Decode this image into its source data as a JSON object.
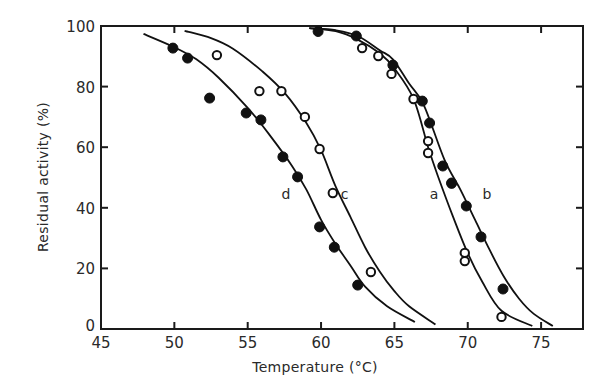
{
  "chart_data": {
    "type": "scatter",
    "title": "",
    "xlabel": "Temperature (°C)",
    "ylabel": "Residual activity (%)",
    "xlim": [
      45,
      78
    ],
    "ylim": [
      0,
      100
    ],
    "xticks": [
      45,
      50,
      55,
      60,
      65,
      70,
      75
    ],
    "yticks": [
      0,
      20,
      40,
      60,
      80,
      100
    ],
    "grid": false,
    "legend": "none (curves labelled inline a, b, c, d)",
    "series": [
      {
        "name": "a",
        "marker": "open",
        "points": [
          [
            62.8,
            92.7
          ],
          [
            63.9,
            90.1
          ],
          [
            64.8,
            84.2
          ],
          [
            66.3,
            75.9
          ],
          [
            67.3,
            62.0
          ],
          [
            67.3,
            58.1
          ],
          [
            68.9,
            48.0
          ],
          [
            69.8,
            25.1
          ],
          [
            69.8,
            22.4
          ],
          [
            72.3,
            4.0
          ]
        ],
        "curve": [
          [
            59.2,
            99.3
          ],
          [
            61,
            98.3
          ],
          [
            62.5,
            95.5
          ],
          [
            64,
            91
          ],
          [
            65,
            86
          ],
          [
            66.3,
            76
          ],
          [
            67.3,
            60
          ],
          [
            68,
            50
          ],
          [
            69,
            37
          ],
          [
            70,
            25
          ],
          [
            71,
            15.5
          ],
          [
            72.3,
            6
          ],
          [
            74.4,
            1
          ]
        ],
        "label_pos": [
          67.7,
          43
        ]
      },
      {
        "name": "b",
        "marker": "filled",
        "points": [
          [
            59.8,
            98.2
          ],
          [
            62.4,
            96.7
          ],
          [
            64.9,
            87.1
          ],
          [
            66.9,
            75.2
          ],
          [
            67.4,
            68.0
          ],
          [
            68.3,
            53.8
          ],
          [
            68.9,
            48.2
          ],
          [
            69.9,
            40.6
          ],
          [
            70.9,
            30.4
          ],
          [
            72.4,
            13.2
          ]
        ],
        "curve": [
          [
            59.2,
            99.3
          ],
          [
            61,
            98.6
          ],
          [
            62.5,
            96.7
          ],
          [
            64,
            92
          ],
          [
            64.9,
            89
          ],
          [
            66,
            81
          ],
          [
            67,
            74
          ],
          [
            68.4,
            56
          ],
          [
            69.5,
            46
          ],
          [
            70.5,
            36
          ],
          [
            71.5,
            26
          ],
          [
            72.5,
            17
          ],
          [
            73.5,
            10
          ],
          [
            74.5,
            5
          ],
          [
            75.8,
            1
          ]
        ],
        "label_pos": [
          71.3,
          43
        ]
      },
      {
        "name": "c",
        "marker": "open",
        "points": [
          [
            52.9,
            90.4
          ],
          [
            55.8,
            78.5
          ],
          [
            57.3,
            78.5
          ],
          [
            58.9,
            70.0
          ],
          [
            59.9,
            59.4
          ],
          [
            60.8,
            44.9
          ],
          [
            63.4,
            18.8
          ]
        ],
        "curve": [
          [
            50.7,
            98.4
          ],
          [
            52.5,
            96
          ],
          [
            54,
            92.5
          ],
          [
            56,
            85
          ],
          [
            57.5,
            78
          ],
          [
            59,
            68
          ],
          [
            60,
            59
          ],
          [
            61,
            47
          ],
          [
            62,
            37
          ],
          [
            63,
            27
          ],
          [
            64,
            19
          ],
          [
            65,
            12.5
          ],
          [
            66,
            7.5
          ],
          [
            67.8,
            1.5
          ]
        ],
        "label_pos": [
          61.6,
          43
        ]
      },
      {
        "name": "d",
        "marker": "filled",
        "points": [
          [
            49.9,
            92.7
          ],
          [
            50.9,
            89.4
          ],
          [
            52.4,
            76.2
          ],
          [
            54.9,
            71.3
          ],
          [
            55.9,
            69.0
          ],
          [
            57.4,
            56.8
          ],
          [
            58.4,
            50.2
          ],
          [
            59.9,
            33.7
          ],
          [
            60.9,
            27.0
          ],
          [
            62.5,
            14.5
          ]
        ],
        "curve": [
          [
            47.9,
            97.4
          ],
          [
            50,
            93
          ],
          [
            51.5,
            89
          ],
          [
            53,
            83
          ],
          [
            55,
            73
          ],
          [
            56.5,
            64
          ],
          [
            58,
            54
          ],
          [
            59,
            46
          ],
          [
            60,
            36
          ],
          [
            61,
            28
          ],
          [
            62,
            21
          ],
          [
            63,
            14
          ],
          [
            64.5,
            7.5
          ],
          [
            66.4,
            2.3
          ]
        ],
        "label_pos": [
          57.6,
          43
        ]
      }
    ]
  },
  "plot_area": {
    "left_px": 101,
    "top_px": 26,
    "right_px": 583,
    "bottom_px": 329,
    "x_per_unit": 14.67,
    "y_per_unit": 3.03
  }
}
